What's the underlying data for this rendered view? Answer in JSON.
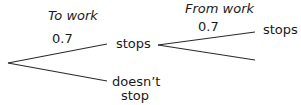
{
  "diagram": {
    "type": "probability-tree",
    "stage_headers": [
      {
        "id": "to-work",
        "label": "To work"
      },
      {
        "id": "from-work",
        "label": "From work"
      }
    ],
    "level1": {
      "branches": [
        {
          "outcome": "stops",
          "probability": "0.7"
        },
        {
          "outcome_line1": "doesn’t",
          "outcome_line2": "stop",
          "probability": ""
        }
      ]
    },
    "level2_after_stops": {
      "branches": [
        {
          "outcome": "stops",
          "probability": "0.7"
        },
        {
          "outcome": "",
          "probability": ""
        }
      ]
    },
    "colors": {
      "line": "#2a2a2a",
      "text": "#1a1a1a",
      "background": "#ffffff"
    }
  }
}
